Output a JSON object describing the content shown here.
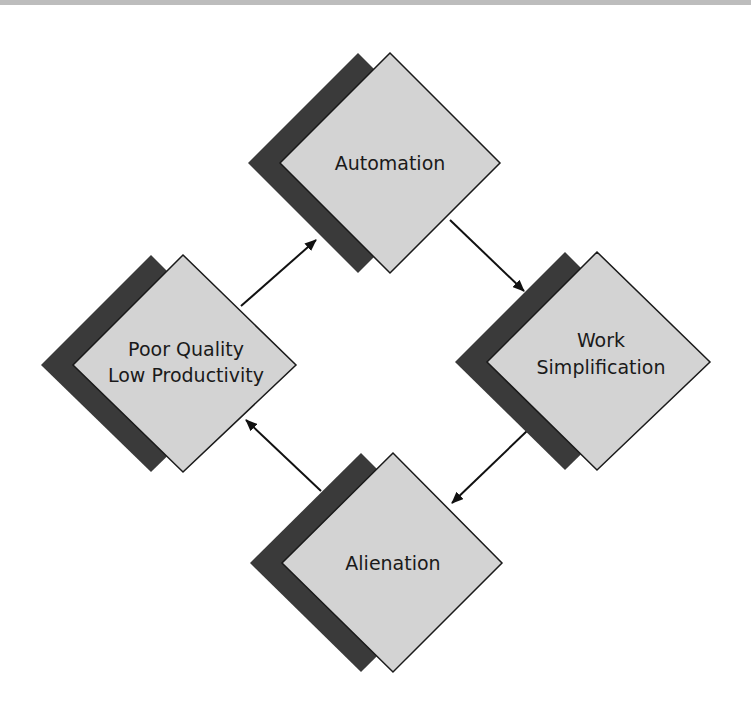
{
  "diagram": {
    "type": "cycle",
    "colors": {
      "front_fill": "#d3d3d3",
      "shadow_fill": "#3a3a3a",
      "stroke": "#1a1a1a",
      "arrow": "#111111"
    },
    "nodes": [
      {
        "id": "automation",
        "lines": [
          "Automation"
        ]
      },
      {
        "id": "work-simplification",
        "lines": [
          "Work",
          "Simplification"
        ]
      },
      {
        "id": "alienation",
        "lines": [
          "Alienation"
        ]
      },
      {
        "id": "poor-quality",
        "lines": [
          "Poor Quality",
          "Low Productivity"
        ]
      }
    ],
    "edges": [
      {
        "from": "automation",
        "to": "work-simplification"
      },
      {
        "from": "work-simplification",
        "to": "alienation"
      },
      {
        "from": "alienation",
        "to": "poor-quality"
      },
      {
        "from": "poor-quality",
        "to": "automation"
      }
    ]
  }
}
